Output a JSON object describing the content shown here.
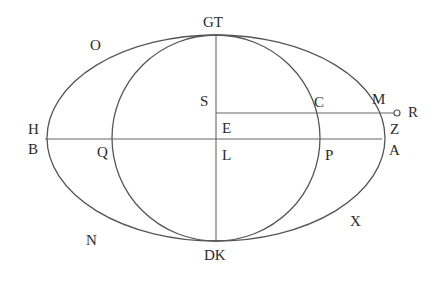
{
  "diagram": {
    "stroke_color": "#555555",
    "background": "#ffffff",
    "center": {
      "x": 216,
      "y": 139
    },
    "outer_ellipse": {
      "rx": 169,
      "ry": 103
    },
    "inner_circle": {
      "rx": 104,
      "ry": 103
    },
    "horizontal_line": {
      "x1": 45,
      "x2": 382,
      "y": 139
    },
    "vertical_line": {
      "x": 216,
      "y1": 35,
      "y2": 241
    },
    "ray_line": {
      "x1": 216,
      "x2": 394,
      "y": 113,
      "end_marker": "small-circle"
    },
    "labels": {
      "GT": "GT",
      "O": "O",
      "S": "S",
      "C": "C",
      "M": "M",
      "R": "R",
      "H": "H",
      "E": "E",
      "Z": "Z",
      "B": "B",
      "Q": "Q",
      "L": "L",
      "P": "P",
      "A": "A",
      "N": "N",
      "X": "X",
      "DK": "DK"
    }
  }
}
